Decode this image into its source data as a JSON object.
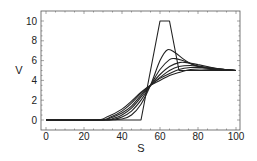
{
  "chart_data": {
    "type": "line",
    "title": "",
    "xlabel": "S",
    "ylabel": "V",
    "xlim": [
      -3,
      102
    ],
    "ylim": [
      -1,
      11
    ],
    "xticks": [
      0,
      20,
      40,
      60,
      80,
      100
    ],
    "yticks": [
      0,
      2,
      4,
      6,
      8,
      10
    ],
    "grid": false,
    "legend": null,
    "series": [
      {
        "name": "curve-0 (initial trapezoid)",
        "x": [
          0,
          50,
          60,
          65,
          70,
          100
        ],
        "y": [
          0,
          0,
          10,
          10,
          5,
          5
        ]
      },
      {
        "name": "curve-1",
        "x": [
          0,
          30,
          40,
          45,
          50,
          55,
          60,
          64,
          68,
          72,
          76,
          80,
          86,
          92,
          100
        ],
        "y": [
          0,
          0,
          0.1,
          0.5,
          1.6,
          3.5,
          6.0,
          7.1,
          6.8,
          6.2,
          5.7,
          5.4,
          5.2,
          5.05,
          5
        ]
      },
      {
        "name": "curve-2",
        "x": [
          0,
          30,
          36,
          40,
          45,
          50,
          55,
          60,
          65,
          68,
          72,
          76,
          80,
          86,
          92,
          100
        ],
        "y": [
          0,
          0,
          0.1,
          0.3,
          0.9,
          2.0,
          3.5,
          5.1,
          6.1,
          6.2,
          6.0,
          5.7,
          5.45,
          5.2,
          5.05,
          5
        ]
      },
      {
        "name": "curve-3",
        "x": [
          0,
          30,
          36,
          40,
          45,
          50,
          55,
          60,
          65,
          70,
          74,
          80,
          86,
          92,
          100
        ],
        "y": [
          0,
          0,
          0.2,
          0.5,
          1.2,
          2.3,
          3.5,
          4.6,
          5.4,
          5.8,
          5.8,
          5.6,
          5.35,
          5.15,
          5
        ]
      },
      {
        "name": "curve-4",
        "x": [
          0,
          28,
          34,
          40,
          45,
          50,
          55,
          60,
          65,
          70,
          76,
          82,
          88,
          94,
          100
        ],
        "y": [
          0,
          0,
          0.2,
          0.7,
          1.4,
          2.5,
          3.5,
          4.3,
          5.0,
          5.4,
          5.5,
          5.4,
          5.25,
          5.1,
          5
        ]
      },
      {
        "name": "curve-5",
        "x": [
          0,
          28,
          34,
          40,
          45,
          50,
          55,
          60,
          65,
          70,
          76,
          82,
          88,
          94,
          100
        ],
        "y": [
          0,
          0,
          0.3,
          0.9,
          1.7,
          2.7,
          3.5,
          4.2,
          4.7,
          5.1,
          5.3,
          5.3,
          5.2,
          5.1,
          5
        ]
      },
      {
        "name": "curve-6",
        "x": [
          0,
          26,
          32,
          40,
          45,
          50,
          55,
          60,
          65,
          70,
          76,
          82,
          88,
          94,
          100
        ],
        "y": [
          0,
          0,
          0.3,
          1.1,
          1.9,
          2.8,
          3.5,
          4.0,
          4.5,
          4.8,
          5.1,
          5.15,
          5.1,
          5.05,
          5
        ]
      }
    ],
    "colors": {
      "line": "#222222",
      "frame": "#555555",
      "background": "#ffffff"
    }
  }
}
